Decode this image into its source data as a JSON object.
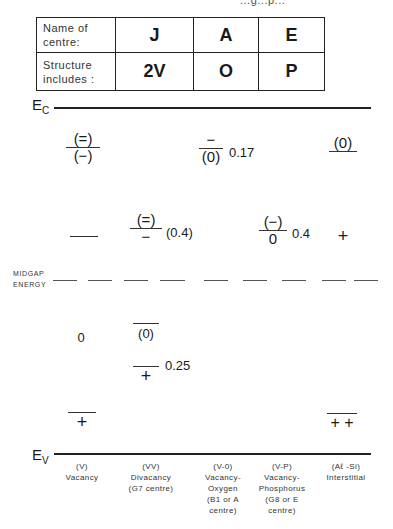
{
  "header_fragment": "...g...p...",
  "table": {
    "rows": [
      {
        "label": "Name of centre:",
        "label_lines": [
          "Name of",
          "centre:"
        ],
        "cells": [
          "J",
          "A",
          "E"
        ]
      },
      {
        "label": "Structure includes :",
        "label_lines": [
          "Structure",
          "includes :"
        ],
        "cells": [
          "2V",
          "O",
          "P"
        ]
      }
    ]
  },
  "bands": {
    "conduction": {
      "symbol": "E",
      "subscript": "C"
    },
    "valence": {
      "symbol": "E",
      "subscript": "V"
    },
    "midgap": {
      "lines": [
        "MIDGAP",
        "ENERGY"
      ]
    }
  },
  "levels": {
    "vacancy": {
      "upper_top": "(=)",
      "upper_bottom": "(−)",
      "mid": "—",
      "lower_charge": "0",
      "bottom_charge": "+"
    },
    "divacancy": {
      "upper_top": "(=)",
      "upper_bottom": "−",
      "upper_value": "(0.4)",
      "lower_top": "(0)",
      "lower2_charge": "+",
      "lower2_value": "0.25"
    },
    "vacancy_oxygen": {
      "top_upper": "−",
      "top_lower": "(0)",
      "value": "0.17"
    },
    "vacancy_phosphorus": {
      "top_upper": "(−)",
      "top_lower": "0",
      "value": "0.4"
    },
    "interstitial": {
      "top_charge": "(0)",
      "mid_charge": "+",
      "bottom_charge": "+ +"
    }
  },
  "defects": [
    {
      "code": "(V)",
      "lines": [
        "Vacancy"
      ]
    },
    {
      "code": "(VV)",
      "lines": [
        "Divacancy",
        "(G7 centre)"
      ]
    },
    {
      "code": "(V-0)",
      "lines": [
        "Vacancy-",
        "Oxygen",
        "(B1 or A",
        "centre)"
      ]
    },
    {
      "code": "(V-P)",
      "lines": [
        "Vacancy-",
        "Phosphorus",
        "(G8 or E",
        "centre)"
      ]
    },
    {
      "code": "(Aℓ -Si)",
      "lines": [
        "Interstitial"
      ]
    }
  ]
}
